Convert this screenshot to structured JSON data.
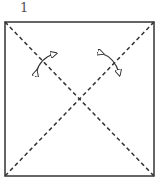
{
  "diagram": {
    "type": "origami-step",
    "step_number": "1",
    "paper": {
      "shape": "square",
      "x": 5,
      "y": 22,
      "width": 149,
      "height": 154
    },
    "fold_lines": [
      {
        "type": "valley",
        "style": "dashed",
        "from": "top-left",
        "to": "bottom-right"
      },
      {
        "type": "valley",
        "style": "dashed",
        "from": "top-right",
        "to": "bottom-left"
      }
    ],
    "arrows": [
      {
        "name": "fold-and-unfold-left",
        "style": "curved-double-headed"
      },
      {
        "name": "fold-and-unfold-right",
        "style": "curved-double-headed"
      }
    ],
    "colors": {
      "outline": "#333333",
      "fold_line": "#333333",
      "background": "#ffffff"
    }
  }
}
